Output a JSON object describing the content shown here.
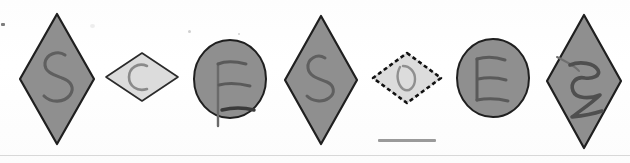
{
  "scene": {
    "title": "Hand-drawn shape strip",
    "background_color": "#ffffff",
    "width": 630,
    "height": 163,
    "divider_color": "#d8d8d8",
    "scale_bar_color": "#9a9a9a"
  },
  "palette": {
    "shape_gray_fill": "#8f8f8f",
    "shape_gray_stroke": "#1f1f1f",
    "shape_light_fill": "#dcdcdc",
    "shape_light_stroke": "#2a2a2a",
    "selection_dash_color": "#111111",
    "ink_color": "#5a5a5a",
    "ink_dark_color": "#444444"
  },
  "shapes": [
    {
      "index": 1,
      "name": "diamond-s-1",
      "shape_type": "diamond",
      "orientation": "tall",
      "letter": "S",
      "fill": "#8f8f8f",
      "stroke": "#1f1f1f",
      "selected": false,
      "x": 18,
      "y": 12,
      "width": 78,
      "height": 134
    },
    {
      "index": 2,
      "name": "diamond-c-2",
      "shape_type": "diamond",
      "orientation": "wide",
      "letter": "C",
      "fill": "#dcdcdc",
      "stroke": "#2a2a2a",
      "selected": false,
      "x": 104,
      "y": 51,
      "width": 76,
      "height": 52
    },
    {
      "index": 3,
      "name": "ellipse-f-3",
      "shape_type": "ellipse",
      "orientation": "upright",
      "letter": "F",
      "fill": "#8f8f8f",
      "stroke": "#1f1f1f",
      "selected": false,
      "x": 192,
      "y": 38,
      "width": 74,
      "height": 80
    },
    {
      "index": 4,
      "name": "diamond-s-4",
      "shape_type": "diamond",
      "orientation": "tall",
      "letter": "S",
      "fill": "#8f8f8f",
      "stroke": "#1f1f1f",
      "selected": false,
      "x": 283,
      "y": 14,
      "width": 76,
      "height": 132
    },
    {
      "index": 5,
      "name": "diamond-d-5",
      "shape_type": "diamond",
      "orientation": "wide",
      "letter": "D",
      "fill": "#dcdcdc",
      "stroke": "#2a2a2a",
      "selected": true,
      "x": 370,
      "y": 50,
      "width": 72,
      "height": 54
    },
    {
      "index": 6,
      "name": "ellipse-e-6",
      "shape_type": "ellipse",
      "orientation": "upright",
      "letter": "E",
      "fill": "#8f8f8f",
      "stroke": "#1f1f1f",
      "selected": false,
      "x": 455,
      "y": 37,
      "width": 76,
      "height": 82
    },
    {
      "index": 7,
      "name": "diamond-e-7",
      "shape_type": "diamond",
      "orientation": "tall",
      "letter": "E",
      "fill": "#8f8f8f",
      "stroke": "#1f1f1f",
      "selected": false,
      "x": 545,
      "y": 13,
      "width": 76,
      "height": 135
    }
  ],
  "annotations": {
    "scale_bar_label": "",
    "edge_speck_label": ""
  }
}
